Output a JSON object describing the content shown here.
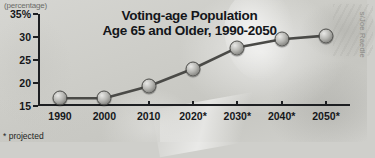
{
  "chart_data": {
    "type": "line",
    "title": "Voting-age Population Age 65 and Older, 1990-2050",
    "title_line1": "Voting-age Population",
    "title_line2": "Age 65 and Older, 1990-2050",
    "unit_label": "(percentage)",
    "xlabel": "",
    "ylabel": "",
    "categories": [
      "1990",
      "2000",
      "2010",
      "2020*",
      "2030*",
      "2040*",
      "2050*"
    ],
    "values": [
      16.7,
      16.7,
      19.3,
      23.1,
      27.7,
      29.5,
      30.3
    ],
    "ylim": [
      15,
      35
    ],
    "yticks": [
      15,
      20,
      25,
      30,
      35
    ],
    "ytick_labels": [
      "15",
      "20",
      "25",
      "30",
      "35%"
    ],
    "grid": false,
    "legend": false,
    "footnote": "* projected",
    "credit": "s/Joe Raedle",
    "marker_color": "#9b9b97",
    "line_color": "#4a4a47",
    "axis_color": "#1d1f22",
    "background_color": "#cdcdc8"
  }
}
